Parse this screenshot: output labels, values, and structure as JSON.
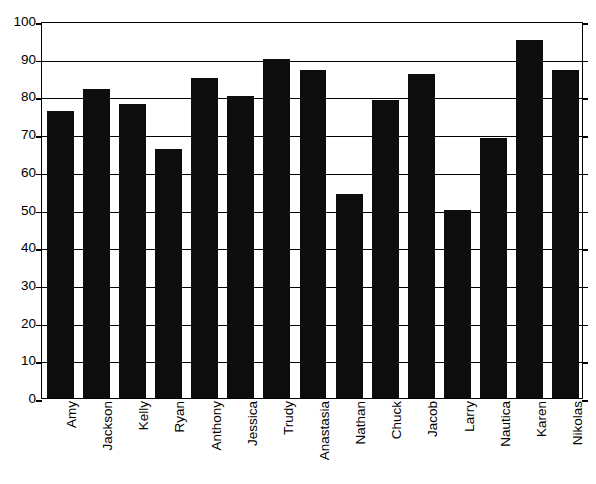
{
  "chart_data": {
    "type": "bar",
    "title": "",
    "subtitle": "",
    "xlabel": "",
    "ylabel": "",
    "categories": [
      "Amy",
      "Jackson",
      "Kelly",
      "Ryan",
      "Anthony",
      "Jessica",
      "Trudy",
      "Anastasia",
      "Nathan",
      "Chuck",
      "Jacob",
      "Larry",
      "Nautica",
      "Karen",
      "Nikolas"
    ],
    "values": [
      76,
      82,
      78,
      66,
      85,
      80,
      90,
      87,
      54,
      79,
      86,
      50,
      69,
      95,
      87
    ],
    "ylim": [
      0,
      100
    ],
    "yticks": [
      0,
      10,
      20,
      30,
      40,
      50,
      60,
      70,
      80,
      90,
      100
    ],
    "ytick_labels": [
      "0",
      "10",
      "20",
      "30",
      "40",
      "50",
      "60",
      "70",
      "80",
      "90",
      "100"
    ],
    "grid": true,
    "grid_axis": "y",
    "legend": false,
    "legend_position": "none",
    "bar_color": "#0d0d0d",
    "background_color": "#ffffff",
    "axis_color": "#000000",
    "xtick_label_rotation": 90
  }
}
